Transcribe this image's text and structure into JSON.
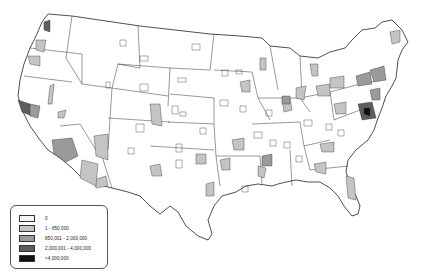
{
  "map": {
    "subject": "United States counties choropleth",
    "legend": {
      "items": [
        {
          "label": "0",
          "color": "#f4f4f4"
        },
        {
          "label": "1 - 850,000",
          "color": "#c4c4c4"
        },
        {
          "label": "850,001 - 2,000,000",
          "color": "#9a9a9a"
        },
        {
          "label": "2,000,001 - 4,000,000",
          "color": "#5e5e5e"
        },
        {
          "label": ">4,000,000",
          "color": "#111111"
        }
      ]
    }
  }
}
